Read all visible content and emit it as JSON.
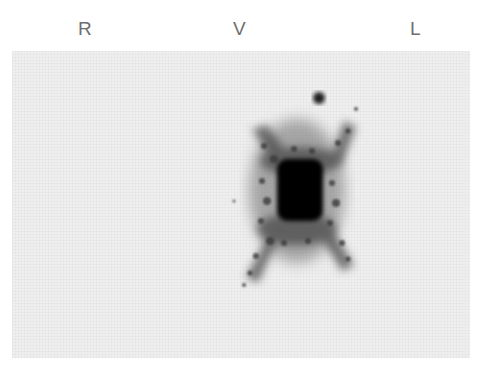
{
  "labels": {
    "right": "R",
    "ventral": "V",
    "left": "L"
  },
  "image": {
    "description": "Grayscale scintigraphy scan with central dense dark uptake region and diffuse radiating tracer spread, small focal spot above-right",
    "background_color": "#efefef",
    "uptake_color": "#000000"
  }
}
